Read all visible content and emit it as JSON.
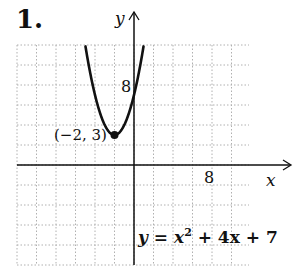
{
  "problem": {
    "number": "1."
  },
  "chart_data": {
    "type": "line",
    "title": "",
    "equation": "y = x² + 4x + 7",
    "equation_parts": {
      "lhs": "y",
      "eq": " = ",
      "x": "x",
      "sup": "2",
      "rest": " + 4x + 7"
    },
    "xlabel": "x",
    "ylabel": "y",
    "x_tick_label": "8",
    "y_tick_label": "8",
    "xlim": [
      -12,
      12
    ],
    "ylim": [
      -10,
      12
    ],
    "grid": true,
    "grid_step": 2,
    "vertex": {
      "x": -2,
      "y": 3,
      "label": "(−2, 3)"
    },
    "series": [
      {
        "name": "y = x^2 + 4x + 7",
        "function": "x^2+4x+7",
        "x_range": [
          -5.2,
          1.2
        ]
      }
    ],
    "colors": {
      "curve": "#111111",
      "grid": "#b0b0b0",
      "axis": "#111111"
    }
  }
}
